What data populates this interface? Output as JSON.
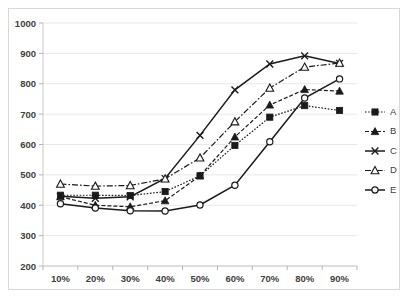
{
  "chart_data": {
    "type": "line",
    "title": "",
    "xlabel": "",
    "ylabel": "",
    "categories": [
      "10%",
      "20%",
      "30%",
      "40%",
      "50%",
      "60%",
      "70%",
      "80%",
      "90%"
    ],
    "ylim": [
      200,
      1000
    ],
    "yticks": [
      200,
      300,
      400,
      500,
      600,
      700,
      800,
      900,
      1000
    ],
    "ytick_labels": [
      "200",
      "300",
      "400",
      "500",
      "600",
      "700",
      "800",
      "900",
      "1000"
    ],
    "grid": "horizontal",
    "legend_position": "right",
    "series": [
      {
        "name": "A",
        "marker": "filled-square",
        "linestyle": "dotted",
        "values": [
          433,
          433,
          432,
          445,
          497,
          597,
          690,
          728,
          712
        ]
      },
      {
        "name": "B",
        "marker": "filled-triangle",
        "linestyle": "dashed",
        "values": [
          428,
          400,
          395,
          415,
          497,
          625,
          730,
          781,
          776
        ]
      },
      {
        "name": "C",
        "marker": "x",
        "linestyle": "solid",
        "values": [
          430,
          423,
          428,
          488,
          630,
          780,
          865,
          892,
          867
        ]
      },
      {
        "name": "D",
        "marker": "open-triangle",
        "linestyle": "dashdot",
        "values": [
          470,
          463,
          465,
          487,
          556,
          675,
          786,
          855,
          868
        ]
      },
      {
        "name": "E",
        "marker": "open-circle",
        "linestyle": "solid",
        "values": [
          405,
          391,
          382,
          381,
          401,
          466,
          609,
          753,
          816
        ]
      }
    ]
  },
  "legend": {
    "entries": [
      {
        "label": "A"
      },
      {
        "label": "B"
      },
      {
        "label": "C"
      },
      {
        "label": "D"
      },
      {
        "label": "E"
      }
    ]
  },
  "colors": {
    "series": "#1a1a1a",
    "grid": "#e8e8e8",
    "axis": "#c9c9c9",
    "text": "#404040",
    "background": "#ffffff",
    "border": "#d9d9d9"
  }
}
